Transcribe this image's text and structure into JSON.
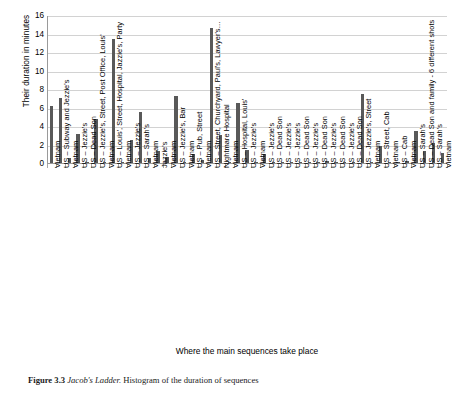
{
  "figure": {
    "caption_label": "Figure 3.3",
    "caption_title": "Jacob's Ladder.",
    "caption_text": "Histogram of the duration of sequences"
  },
  "chart_data": {
    "type": "bar",
    "title": "",
    "xlabel": "Where the main sequences take place",
    "ylabel": "Their duration in minutes",
    "ylim": [
      0,
      16
    ],
    "ytick_step": 2,
    "yticks": [
      0,
      2,
      4,
      6,
      8,
      10,
      12,
      14,
      16
    ],
    "grid": true,
    "legend": "none",
    "bar_color": "#595959",
    "gridline_color": "#d2d2d2",
    "axis_color": "#9a9a9a",
    "categories": [
      "Vietnam",
      "US – Subway and Jezzie's",
      "Vietnam",
      "US – Jezzie's",
      "US – Dead Son",
      "US – Jezzie's, Street, Post Office, Louis'",
      "Vietnam",
      "US – Louis', Street, Hospital, Jazzie's, Party",
      "Vietnam",
      "US – Jezzie's",
      "US – Sarah's",
      "Vietnam",
      "Jazzie's",
      "Vietnam",
      "US – Jezzie's, Bar",
      "Vietnam",
      "US – Pub, Street",
      "Vietnam",
      "US – Street, Churchyard, Paul's, Lawyer's…",
      "Nightmare Hospital",
      "Vietnam",
      "US – Hospital, Louis'",
      "US – Jezzie's",
      "Vietnam",
      "US – Jezzie's",
      "US – Dead Son",
      "US – Jezzie's",
      "US – Jezzie's",
      "US – Dead Son",
      "US – Jezzie's",
      "US – Dead Son",
      "US – Jezzie's",
      "US – Dead Son",
      "US – Jezzie's",
      "US – Dead Son",
      "US – Jezzie's, Street",
      "Vietnam",
      "US – Street, Cab",
      "Vietnam",
      "US – Cab",
      "Vietnam",
      "US – Sarah's",
      "US – Dead Son and family - 6 different shots",
      "US – Sarah's",
      "Vietnam"
    ],
    "values": [
      6.2,
      7.1,
      0.5,
      3.2,
      0.1,
      4.75,
      0.15,
      13.5,
      0.15,
      2.5,
      5.5,
      0.5,
      1.35,
      0.7,
      7.3,
      0.1,
      1.0,
      0.3,
      14.7,
      3.1,
      0.15,
      6.5,
      1.4,
      0.1,
      0.95,
      0.05,
      0.05,
      0.1,
      0.05,
      0.12,
      0.05,
      0.18,
      0.05,
      0.1,
      0.05,
      7.5,
      0.15,
      1.8,
      0.15,
      0.05,
      0.2,
      3.45,
      1.35,
      2.2,
      1.1
    ]
  }
}
